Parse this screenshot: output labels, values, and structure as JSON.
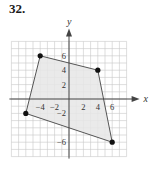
{
  "problem": {
    "number": "32."
  },
  "chart_data": {
    "type": "scatter",
    "title": "",
    "xlabel": "x",
    "ylabel": "y",
    "xlim": [
      -8,
      8
    ],
    "ylim": [
      -8,
      8
    ],
    "grid": true,
    "grid_step": 1,
    "x_tick_labels": [
      "-4",
      "-2",
      "2",
      "4",
      "6"
    ],
    "y_tick_labels": [
      "6",
      "4",
      "2",
      "-2",
      "-6"
    ],
    "polygon": {
      "shaded": true,
      "fill_color": "#e6e6e6",
      "edge_color": "#555555",
      "vertices": [
        {
          "x": -4,
          "y": 6
        },
        {
          "x": 4,
          "y": 4
        },
        {
          "x": 6,
          "y": -6
        },
        {
          "x": -6,
          "y": -2
        }
      ]
    },
    "points": [
      {
        "x": -4,
        "y": 6
      },
      {
        "x": 4,
        "y": 4
      },
      {
        "x": 6,
        "y": -6
      },
      {
        "x": -6,
        "y": -2
      }
    ]
  },
  "colors": {
    "grid": "#c8c8c8",
    "axis": "#444444",
    "point": "#111111"
  }
}
